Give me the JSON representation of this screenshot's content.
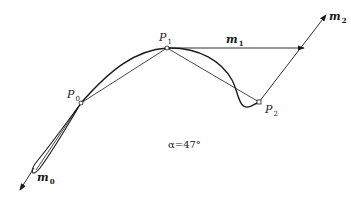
{
  "figure": {
    "points": {
      "p0": {
        "name": "P",
        "sub": "0"
      },
      "p1": {
        "name": "P",
        "sub": "1"
      },
      "p2": {
        "name": "P",
        "sub": "2"
      }
    },
    "vectors": {
      "m0": {
        "name": "m",
        "sub": "0"
      },
      "m1": {
        "name": "m",
        "sub": "1"
      },
      "m2": {
        "name": "m",
        "sub": "2"
      }
    },
    "annotation": "α=47°",
    "colors": {
      "stroke": "#1a1a1a",
      "background": "#ffffff"
    }
  }
}
